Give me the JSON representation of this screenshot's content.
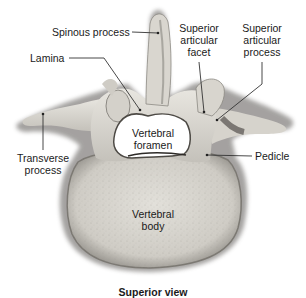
{
  "diagram": {
    "title": "Superior view",
    "labels": {
      "spinous_process": "Spinous process",
      "lamina": "Lamina",
      "superior_articular_facet_1": "Superior",
      "superior_articular_facet_2": "articular",
      "superior_articular_facet_3": "facet",
      "superior_articular_process_1": "Superior",
      "superior_articular_process_2": "articular",
      "superior_articular_process_3": "process",
      "transverse_process_1": "Transverse",
      "transverse_process_2": "process",
      "vertebral_foramen_1": "Vertebral",
      "vertebral_foramen_2": "foramen",
      "pedicle": "Pedicle",
      "vertebral_body_1": "Vertebral",
      "vertebral_body_2": "body"
    },
    "colors": {
      "bone_light": "#e4e2dc",
      "bone_mid": "#c9c6bf",
      "bone_shadow": "#6e6b66",
      "leader_line": "#333333",
      "text": "#1a1a1a",
      "background": "#ffffff"
    }
  }
}
